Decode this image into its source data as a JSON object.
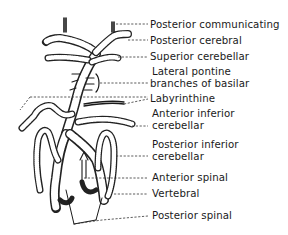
{
  "figure": {
    "ink_color": "#1a1a1a",
    "background": "#ffffff",
    "labels": [
      {
        "id": "posterior-communicating",
        "text": "Posterior communicating",
        "x": 150,
        "y": 13
      },
      {
        "id": "posterior-cerebral",
        "text": "Posterior cerebral",
        "x": 150,
        "y": 29
      },
      {
        "id": "superior-cerebellar",
        "text": "Superior cerebellar",
        "x": 150,
        "y": 45
      },
      {
        "id": "lateral-pontine-1",
        "text": "Lateral pontine",
        "x": 152,
        "y": 61
      },
      {
        "id": "lateral-pontine-2",
        "text": "branches of basilar",
        "x": 150,
        "y": 74
      },
      {
        "id": "labyrinthine",
        "text": "Labyrinthine",
        "x": 150,
        "y": 91
      },
      {
        "id": "anterior-inferior-1",
        "text": "Anterior inferior",
        "x": 152,
        "y": 107
      },
      {
        "id": "anterior-inferior-2",
        "text": "cerebellar",
        "x": 152,
        "y": 120
      },
      {
        "id": "posterior-inferior-1",
        "text": "Posterior inferior",
        "x": 152,
        "y": 138
      },
      {
        "id": "posterior-inferior-2",
        "text": "cerebellar",
        "x": 152,
        "y": 151
      },
      {
        "id": "anterior-spinal",
        "text": "Anterior spinal",
        "x": 152,
        "y": 170
      },
      {
        "id": "vertebral",
        "text": "Vertebral",
        "x": 152,
        "y": 186
      },
      {
        "id": "posterior-spinal",
        "text": "Posterior spinal",
        "x": 152,
        "y": 209
      }
    ]
  }
}
